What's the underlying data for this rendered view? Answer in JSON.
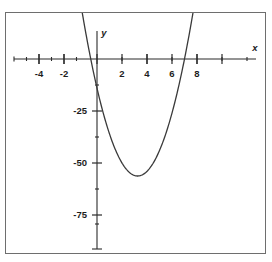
{
  "figure": {
    "background_color": "#ffffff",
    "frame_color": "#6e6e6e",
    "curve_color": "#3a3a3a",
    "axis_color": "#2b2b2b",
    "text_color": "#1d1d1d"
  },
  "chart_data": {
    "type": "line",
    "title": "",
    "subtitle": "",
    "xlabel": "x",
    "ylabel": "y",
    "grid": false,
    "legend": null,
    "xlim": [
      -5.1,
      9.7
    ],
    "ylim": [
      -100,
      22
    ],
    "x_ticks_major": [
      -4,
      -2,
      2,
      4,
      6,
      8
    ],
    "x_tick_labels": [
      "-4",
      "-2",
      "2",
      "4",
      "6",
      "8"
    ],
    "x_ticks_minor": [
      -5,
      -3,
      -1,
      1,
      3,
      5,
      7,
      9
    ],
    "y_ticks_major": [
      -25,
      -50,
      -75
    ],
    "y_tick_labels": [
      "-25",
      "-50",
      "-75"
    ],
    "y_ticks_minor": [
      -12.5,
      -37.5,
      -62.5,
      -87.5,
      -100
    ],
    "curve": {
      "name": "parabola",
      "equation_form": "quadratic",
      "vertex": [
        3.25,
        -70
      ],
      "x_intercepts": [
        -0.5,
        7
      ],
      "y_intercept": -14,
      "opens": "upward",
      "coefficients": {
        "a": 4,
        "b": -26,
        "c": -14
      },
      "x": [
        -1.05,
        -0.8,
        -0.5,
        -0.25,
        0,
        0.5,
        1,
        1.5,
        2,
        2.5,
        3,
        3.25,
        3.5,
        4,
        4.5,
        5,
        5.5,
        6,
        6.5,
        7,
        7.25,
        7.5,
        7.8
      ],
      "y": [
        17.7,
        9.4,
        0,
        -7.3,
        -14,
        -25,
        -36,
        -44,
        -50,
        -54,
        -56,
        -56.25,
        -56,
        -50,
        -44,
        -36,
        -25,
        -14,
        0,
        0,
        8.75,
        15,
        24
      ]
    }
  },
  "axis_labels": {
    "x_axis_name": "x",
    "y_axis_name": "y"
  }
}
